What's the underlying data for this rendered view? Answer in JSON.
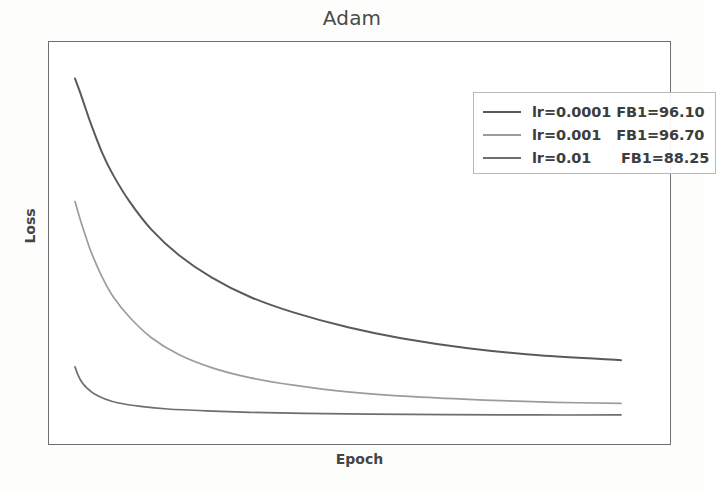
{
  "chart_data": {
    "type": "line",
    "title": "Adam",
    "xlabel": "Epoch",
    "ylabel": "Loss",
    "grid": false,
    "legend_position": "upper right",
    "xticks": [],
    "yticks": [],
    "xlim": [
      0,
      1
    ],
    "ylim": [
      0,
      1
    ],
    "series": [
      {
        "name": "lr=0.0001",
        "lr_label": "lr=0.0001",
        "fb1_label": "FB1=96.10",
        "fb1": 96.1,
        "color": "#5a5a5a",
        "x": [
          0.0,
          0.01,
          0.02,
          0.03,
          0.05,
          0.07,
          0.1,
          0.14,
          0.19,
          0.25,
          0.32,
          0.4,
          0.5,
          0.6,
          0.72,
          0.85,
          1.0
        ],
        "y": [
          0.945,
          0.905,
          0.862,
          0.82,
          0.745,
          0.686,
          0.615,
          0.54,
          0.472,
          0.412,
          0.36,
          0.318,
          0.278,
          0.248,
          0.222,
          0.203,
          0.19
        ]
      },
      {
        "name": "lr=0.001",
        "lr_label": "lr=0.001",
        "fb1_label": "FB1=96.70",
        "fb1": 96.7,
        "color": "#9c9c9c",
        "x": [
          0.0,
          0.01,
          0.02,
          0.03,
          0.05,
          0.07,
          0.1,
          0.14,
          0.19,
          0.25,
          0.32,
          0.4,
          0.5,
          0.62,
          0.75,
          0.88,
          1.0
        ],
        "y": [
          0.615,
          0.565,
          0.52,
          0.478,
          0.412,
          0.36,
          0.305,
          0.25,
          0.205,
          0.17,
          0.143,
          0.123,
          0.105,
          0.092,
          0.083,
          0.077,
          0.074
        ]
      },
      {
        "name": "lr=0.01",
        "lr_label": "lr=0.01",
        "fb1_label": "FB1=88.25",
        "fb1": 88.25,
        "color": "#6e6e6e",
        "x": [
          0.0,
          0.005,
          0.012,
          0.022,
          0.035,
          0.055,
          0.08,
          0.12,
          0.17,
          0.24,
          0.32,
          0.42,
          0.54,
          0.68,
          0.84,
          1.0
        ],
        "y": [
          0.172,
          0.152,
          0.132,
          0.115,
          0.1,
          0.086,
          0.075,
          0.066,
          0.059,
          0.054,
          0.05,
          0.047,
          0.045,
          0.044,
          0.043,
          0.043
        ]
      }
    ]
  },
  "colors": {
    "frame": "#6f6f6f",
    "title": "#4a4a4a",
    "axis_label": "#454545",
    "legend_border": "#b9b9b9",
    "background": "#ffffff"
  }
}
